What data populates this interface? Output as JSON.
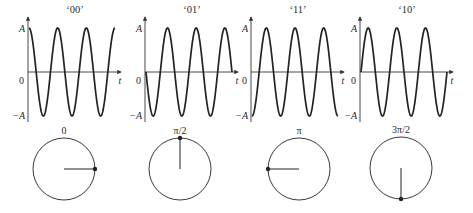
{
  "diagram": {
    "title": "",
    "colors": {
      "stroke": "#222222",
      "axis": "#333333",
      "text": "#2a2a2a",
      "background": "#ffffff"
    },
    "axis_labels": {
      "amplitude_pos": "A",
      "amplitude_neg": "−A",
      "zero": "0",
      "time": "t"
    },
    "panels": [
      {
        "symbol": "‘00’",
        "phase_label": "0",
        "phase_rad": 0,
        "axis_x": 28,
        "circle_cx": 64,
        "circle_cy": 169
      },
      {
        "symbol": "‘01’",
        "phase_label": "π/2",
        "phase_rad": 1.5708,
        "axis_x": 145,
        "circle_cx": 180,
        "circle_cy": 169
      },
      {
        "symbol": "‘11’",
        "phase_label": "π",
        "phase_rad": 3.1416,
        "axis_x": 251,
        "circle_cx": 299,
        "circle_cy": 169
      },
      {
        "symbol": "‘10’",
        "phase_label": "3π/2",
        "phase_rad": 4.7124,
        "axis_x": 360,
        "circle_cx": 401,
        "circle_cy": 168
      }
    ],
    "waveform": {
      "periods": 3.0,
      "plot_width": 88,
      "amplitude_px": 44,
      "zero_y": 72,
      "axis_top": 17,
      "axis_bottom": 122
    },
    "phasor": {
      "radius": 31,
      "dot_radius": 2.2
    }
  }
}
